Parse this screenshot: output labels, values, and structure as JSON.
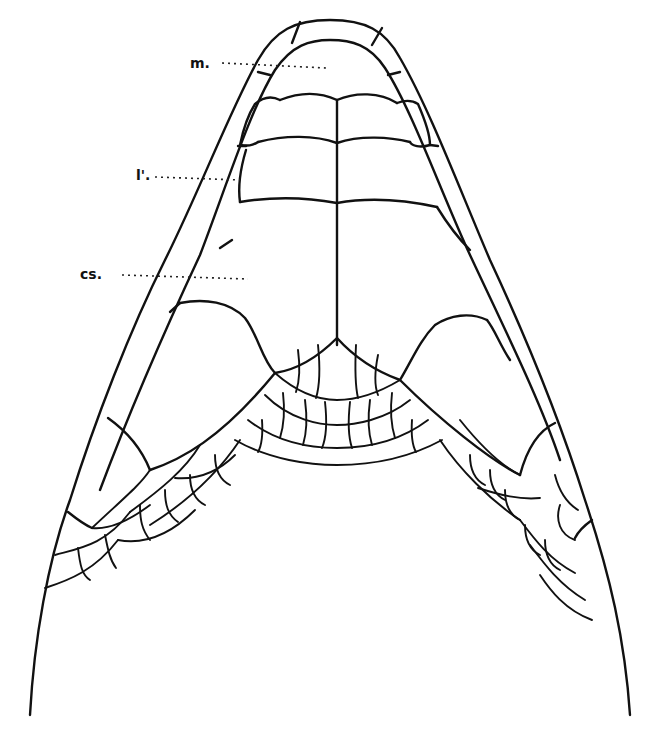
{
  "figure": {
    "labels": [
      {
        "id": "m",
        "text": "m.",
        "x": 190,
        "y": 67
      },
      {
        "id": "l",
        "text": "l'.",
        "x": 136,
        "y": 176
      },
      {
        "id": "cs",
        "text": "cs.",
        "x": 80,
        "y": 274
      }
    ],
    "line_color": "#111111",
    "background": "#ffffff"
  }
}
